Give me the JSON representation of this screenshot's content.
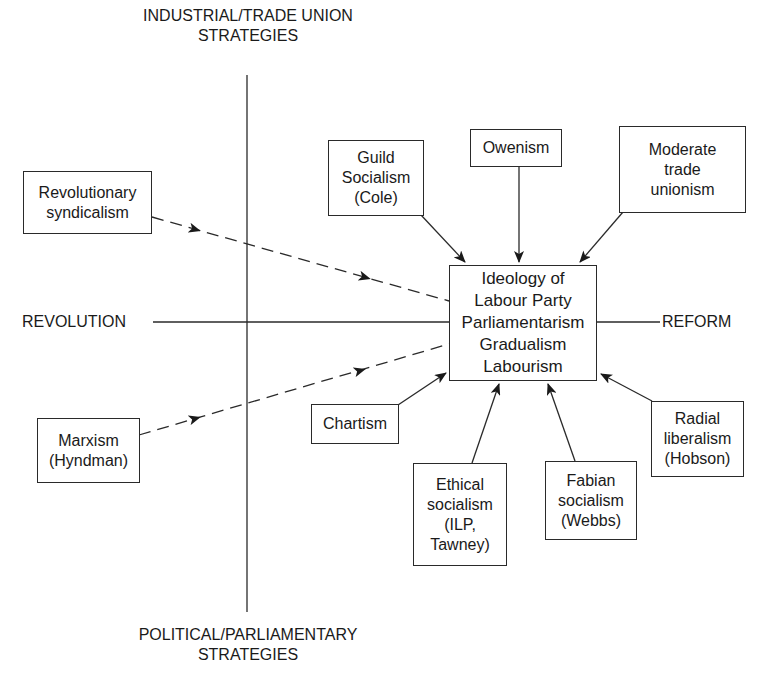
{
  "axes": {
    "top": [
      "INDUSTRIAL/TRADE UNION",
      "STRATEGIES"
    ],
    "bottom": [
      "POLITICAL/PARLIAMENTARY",
      "STRATEGIES"
    ],
    "left": "REVOLUTION",
    "right": "REFORM"
  },
  "center": {
    "lines": [
      "Ideology of",
      "Labour Party",
      "Parliamentarism",
      "Gradualism",
      "Labourism"
    ]
  },
  "nodes": {
    "revolutionary_syndicalism": [
      "Revolutionary",
      "syndicalism"
    ],
    "guild_socialism": [
      "Guild",
      "Socialism",
      "(Cole)"
    ],
    "owenism": [
      "Owenism"
    ],
    "moderate_trade_unionism": [
      "Moderate",
      "trade",
      "unionism"
    ],
    "marxism": [
      "Marxism",
      "(Hyndman)"
    ],
    "chartism": [
      "Chartism"
    ],
    "ethical_socialism": [
      "Ethical",
      "socialism",
      "(ILP,",
      "Tawney)"
    ],
    "fabian_socialism": [
      "Fabian",
      "socialism",
      "(Webbs)"
    ],
    "radial_liberalism": [
      "Radial",
      "liberalism",
      "(Hobson)"
    ]
  },
  "edges": [
    {
      "from": "Revolutionary syndicalism",
      "to": "Ideology of Labour Party",
      "style": "dashed"
    },
    {
      "from": "Marxism (Hyndman)",
      "to": "Ideology of Labour Party",
      "style": "dashed"
    },
    {
      "from": "Guild Socialism (Cole)",
      "to": "Ideology of Labour Party",
      "style": "solid"
    },
    {
      "from": "Owenism",
      "to": "Ideology of Labour Party",
      "style": "solid"
    },
    {
      "from": "Moderate trade unionism",
      "to": "Ideology of Labour Party",
      "style": "solid"
    },
    {
      "from": "Chartism",
      "to": "Ideology of Labour Party",
      "style": "solid"
    },
    {
      "from": "Ethical socialism (ILP, Tawney)",
      "to": "Ideology of Labour Party",
      "style": "solid"
    },
    {
      "from": "Fabian socialism (Webbs)",
      "to": "Ideology of Labour Party",
      "style": "solid"
    },
    {
      "from": "Radial liberalism (Hobson)",
      "to": "Ideology of Labour Party",
      "style": "solid"
    }
  ]
}
